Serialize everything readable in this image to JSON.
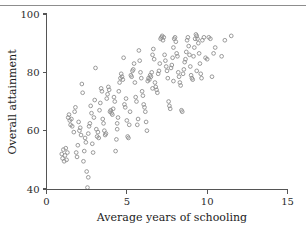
{
  "figure": {
    "background_color": "#ffffff",
    "rule_color": "#8d8d8d",
    "axis_color": "#555555",
    "point_color": "#8f8f8f"
  },
  "chart_data": {
    "type": "scatter",
    "title": "",
    "xlabel": "Average years of schooling",
    "ylabel": "Overall attainment",
    "xlim": [
      0,
      15
    ],
    "ylim": [
      40,
      100
    ],
    "xticks": [
      0,
      5,
      10,
      15
    ],
    "yticks": [
      40,
      60,
      80,
      100
    ],
    "xtick_labels": [
      "0",
      "5",
      "10",
      "15"
    ],
    "ytick_labels": [
      "40",
      "60",
      "80",
      "100"
    ],
    "grid": false,
    "legend": null,
    "marker": "open-circle",
    "n_points": 186,
    "points": [
      [
        0.95,
        52.0
      ],
      [
        1.0,
        50.5
      ],
      [
        1.05,
        53.5
      ],
      [
        1.1,
        49.5
      ],
      [
        1.15,
        51.5
      ],
      [
        1.2,
        54.0
      ],
      [
        1.25,
        50.0
      ],
      [
        1.3,
        52.5
      ],
      [
        1.35,
        64.5
      ],
      [
        1.4,
        65.5
      ],
      [
        1.45,
        63.5
      ],
      [
        1.5,
        62.0
      ],
      [
        1.55,
        64.0
      ],
      [
        1.6,
        61.5
      ],
      [
        1.7,
        59.5
      ],
      [
        1.75,
        66.5
      ],
      [
        1.8,
        68.0
      ],
      [
        1.85,
        52.5
      ],
      [
        1.9,
        51.0
      ],
      [
        1.95,
        55.0
      ],
      [
        2.0,
        63.0
      ],
      [
        2.05,
        60.0
      ],
      [
        2.1,
        61.0
      ],
      [
        2.15,
        58.5
      ],
      [
        2.2,
        76.0
      ],
      [
        2.25,
        73.0
      ],
      [
        2.3,
        49.5
      ],
      [
        2.35,
        53.0
      ],
      [
        2.4,
        57.5
      ],
      [
        2.45,
        56.0
      ],
      [
        2.5,
        46.0
      ],
      [
        2.55,
        40.5
      ],
      [
        2.6,
        59.0
      ],
      [
        2.65,
        61.5
      ],
      [
        2.7,
        62.5
      ],
      [
        2.75,
        68.5
      ],
      [
        2.8,
        66.0
      ],
      [
        2.85,
        55.5
      ],
      [
        2.9,
        52.5
      ],
      [
        2.95,
        64.5
      ],
      [
        3.0,
        70.5
      ],
      [
        3.05,
        81.5
      ],
      [
        3.1,
        60.5
      ],
      [
        3.15,
        58.0
      ],
      [
        3.2,
        59.5
      ],
      [
        3.25,
        57.5
      ],
      [
        3.3,
        67.0
      ],
      [
        3.35,
        69.5
      ],
      [
        3.4,
        74.5
      ],
      [
        3.45,
        73.5
      ],
      [
        3.5,
        64.0
      ],
      [
        3.55,
        62.5
      ],
      [
        3.6,
        60.0
      ],
      [
        3.65,
        58.5
      ],
      [
        3.7,
        59.0
      ],
      [
        3.75,
        71.0
      ],
      [
        3.8,
        72.5
      ],
      [
        3.85,
        75.0
      ],
      [
        3.9,
        74.0
      ],
      [
        3.95,
        66.5
      ],
      [
        4.0,
        67.0
      ],
      [
        4.05,
        66.0
      ],
      [
        4.1,
        65.5
      ],
      [
        4.15,
        67.5
      ],
      [
        4.2,
        71.5
      ],
      [
        4.25,
        70.0
      ],
      [
        4.3,
        53.0
      ],
      [
        4.35,
        57.0
      ],
      [
        4.4,
        62.5
      ],
      [
        4.45,
        64.5
      ],
      [
        4.5,
        73.5
      ],
      [
        4.55,
        76.5
      ],
      [
        4.6,
        78.0
      ],
      [
        4.65,
        79.5
      ],
      [
        4.7,
        78.5
      ],
      [
        4.75,
        77.5
      ],
      [
        4.8,
        85.0
      ],
      [
        4.85,
        69.0
      ],
      [
        4.9,
        68.0
      ],
      [
        4.95,
        71.0
      ],
      [
        5.0,
        63.5
      ],
      [
        5.05,
        58.0
      ],
      [
        5.1,
        57.5
      ],
      [
        5.15,
        62.0
      ],
      [
        5.2,
        66.5
      ],
      [
        5.25,
        79.0
      ],
      [
        5.3,
        78.5
      ],
      [
        5.35,
        80.5
      ],
      [
        5.4,
        81.0
      ],
      [
        5.45,
        83.0
      ],
      [
        5.5,
        76.5
      ],
      [
        5.55,
        71.5
      ],
      [
        5.6,
        70.0
      ],
      [
        5.65,
        62.0
      ],
      [
        5.7,
        64.0
      ],
      [
        5.75,
        87.5
      ],
      [
        5.8,
        84.0
      ],
      [
        5.85,
        80.0
      ],
      [
        5.9,
        78.0
      ],
      [
        5.95,
        73.5
      ],
      [
        6.0,
        72.0
      ],
      [
        6.05,
        69.0
      ],
      [
        6.1,
        68.0
      ],
      [
        6.15,
        66.5
      ],
      [
        6.2,
        63.0
      ],
      [
        6.25,
        60.0
      ],
      [
        6.3,
        77.0
      ],
      [
        6.35,
        78.0
      ],
      [
        6.4,
        77.5
      ],
      [
        6.45,
        79.0
      ],
      [
        6.5,
        78.5
      ],
      [
        6.55,
        80.0
      ],
      [
        6.6,
        86.0
      ],
      [
        6.65,
        88.0
      ],
      [
        6.7,
        84.5
      ],
      [
        6.75,
        76.5
      ],
      [
        6.8,
        75.0
      ],
      [
        6.85,
        74.0
      ],
      [
        6.9,
        73.0
      ],
      [
        6.95,
        79.5
      ],
      [
        7.0,
        80.5
      ],
      [
        7.05,
        83.0
      ],
      [
        7.1,
        91.5
      ],
      [
        7.15,
        92.0
      ],
      [
        7.2,
        92.5
      ],
      [
        7.25,
        91.0
      ],
      [
        7.3,
        92.0
      ],
      [
        7.35,
        86.0
      ],
      [
        7.4,
        84.0
      ],
      [
        7.45,
        82.0
      ],
      [
        7.5,
        80.5
      ],
      [
        7.55,
        78.0
      ],
      [
        7.6,
        70.0
      ],
      [
        7.65,
        68.5
      ],
      [
        7.7,
        67.5
      ],
      [
        7.75,
        81.5
      ],
      [
        7.8,
        82.5
      ],
      [
        7.85,
        85.0
      ],
      [
        7.9,
        88.5
      ],
      [
        7.95,
        91.5
      ],
      [
        8.0,
        92.0
      ],
      [
        8.05,
        90.5
      ],
      [
        8.1,
        86.5
      ],
      [
        8.15,
        85.5
      ],
      [
        8.2,
        80.0
      ],
      [
        8.25,
        78.5
      ],
      [
        8.3,
        76.5
      ],
      [
        8.35,
        75.5
      ],
      [
        8.4,
        67.0
      ],
      [
        8.45,
        66.5
      ],
      [
        8.5,
        79.5
      ],
      [
        8.55,
        81.0
      ],
      [
        8.6,
        83.5
      ],
      [
        8.65,
        84.5
      ],
      [
        8.7,
        87.0
      ],
      [
        8.75,
        91.0
      ],
      [
        8.8,
        92.0
      ],
      [
        8.85,
        89.0
      ],
      [
        8.9,
        86.0
      ],
      [
        8.95,
        82.0
      ],
      [
        9.0,
        79.0
      ],
      [
        9.05,
        78.0
      ],
      [
        9.1,
        77.5
      ],
      [
        9.15,
        85.5
      ],
      [
        9.2,
        88.5
      ],
      [
        9.25,
        91.5
      ],
      [
        9.3,
        93.0
      ],
      [
        9.35,
        92.5
      ],
      [
        9.4,
        91.5
      ],
      [
        9.45,
        90.0
      ],
      [
        9.5,
        86.5
      ],
      [
        9.55,
        83.0
      ],
      [
        9.6,
        79.5
      ],
      [
        9.65,
        78.0
      ],
      [
        9.7,
        91.0
      ],
      [
        9.8,
        92.0
      ],
      [
        9.9,
        85.0
      ],
      [
        10.0,
        84.5
      ],
      [
        10.1,
        92.0
      ],
      [
        10.2,
        91.5
      ],
      [
        10.3,
        78.5
      ],
      [
        10.4,
        86.5
      ],
      [
        10.5,
        88.5
      ],
      [
        10.9,
        85.5
      ],
      [
        11.1,
        91.0
      ],
      [
        11.5,
        92.5
      ],
      [
        2.6,
        44.0
      ],
      [
        4.4,
        60.5
      ],
      [
        6.6,
        74.5
      ],
      [
        7.9,
        77.0
      ],
      [
        9.35,
        80.5
      ]
    ]
  }
}
